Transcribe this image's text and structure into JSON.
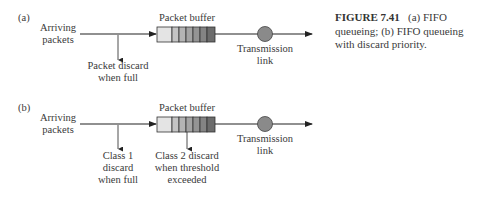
{
  "figure": {
    "caption_label": "FIGURE 7.41",
    "caption_text_line1": "(a) FIFO",
    "caption_text_line2": "queueing; (b) FIFO queueing",
    "caption_text_line3": "with discard priority."
  },
  "panel_a": {
    "label": "(a)",
    "input_line1": "Arriving",
    "input_line2": "packets",
    "buffer_label": "Packet buffer",
    "discard_line1": "Packet discard",
    "discard_line2": "when full",
    "link_line1": "Transmission",
    "link_line2": "link"
  },
  "panel_b": {
    "label": "(b)",
    "input_line1": "Arriving",
    "input_line2": "packets",
    "buffer_label": "Packet buffer",
    "class1_line1": "Class 1",
    "class1_line2": "discard",
    "class1_line3": "when full",
    "class2_line1": "Class 2 discard",
    "class2_line2": "when threshold",
    "class2_line3": "exceeded",
    "link_line1": "Transmission",
    "link_line2": "link"
  },
  "colors": {
    "line": "#222222",
    "buffer_cells": [
      "#e4e4e4",
      "#c4c4c4",
      "#b4b4b4",
      "#a4a4a4",
      "#949494",
      "#848484",
      "#6c6c6c"
    ],
    "server": "#8a8a8a"
  }
}
